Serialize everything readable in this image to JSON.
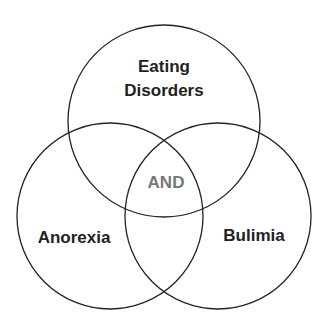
{
  "diagram": {
    "type": "venn",
    "sets": [
      {
        "id": "top",
        "label_line1": "Eating",
        "label_line2": "Disorders"
      },
      {
        "id": "left",
        "label": "Anorexia"
      },
      {
        "id": "right",
        "label": "Bulimia"
      }
    ],
    "center_label": "AND",
    "colors": {
      "stroke": "#222222",
      "text": "#222222",
      "center_text": "#777777",
      "background": "#ffffff"
    }
  }
}
